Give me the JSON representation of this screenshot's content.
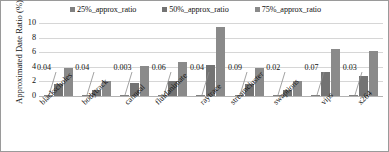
{
  "chart": {
    "ylabel": "Approximated Date Ratio (%)",
    "yticks": [
      "10",
      "8",
      "6",
      "4",
      "2",
      "0"
    ]
  },
  "legend": [
    {
      "label": "25%_approx_ratio",
      "color": "#808080"
    },
    {
      "label": "50%_approx_ratio",
      "color": "#737373"
    },
    {
      "label": "75%_approx_ratio",
      "color": "#8a8a8a"
    }
  ],
  "groups": [
    {
      "category": "blackscholes",
      "callout": "0.04"
    },
    {
      "category": "bodytrack",
      "callout": "0.04"
    },
    {
      "category": "canneal",
      "callout": "0.003"
    },
    {
      "category": "fluidanimate",
      "callout": "0.06"
    },
    {
      "category": "raytrace",
      "callout": "0.04"
    },
    {
      "category": "streamcluster",
      "callout": "0.09"
    },
    {
      "category": "swaptions",
      "callout": "0.02"
    },
    {
      "category": "vips",
      "callout": "0.07"
    },
    {
      "category": "x264",
      "callout": "0.03"
    }
  ],
  "chart_data": {
    "type": "bar",
    "title": "",
    "xlabel": "",
    "ylabel": "Approximated Date Ratio (%)",
    "ylim": [
      0,
      10
    ],
    "ytick_values": [
      0,
      2,
      4,
      6,
      8,
      10
    ],
    "grid": true,
    "legend_position": "top-center",
    "categories": [
      "blackscholes",
      "bodytrack",
      "canneal",
      "fluidanimate",
      "raytrace",
      "streamcluster",
      "swaptions",
      "vips",
      "x264"
    ],
    "series": [
      {
        "name": "25%_approx_ratio",
        "color": "#808080",
        "values": [
          0.04,
          0.04,
          0.003,
          0.06,
          0.04,
          0.09,
          0.02,
          0.07,
          0.03
        ]
      },
      {
        "name": "50%_approx_ratio",
        "color": "#737373",
        "values": [
          1.7,
          0.85,
          1.8,
          2.0,
          4.3,
          1.7,
          0.85,
          3.35,
          2.75
        ]
      },
      {
        "name": "75%_approx_ratio",
        "color": "#8a8a8a",
        "values": [
          3.85,
          2.05,
          4.1,
          4.6,
          9.4,
          3.9,
          2.0,
          6.5,
          6.2
        ]
      }
    ],
    "data_labels": {
      "series": "25%_approx_ratio",
      "values": [
        "0.04",
        "0.04",
        "0.003",
        "0.06",
        "0.04",
        "0.09",
        "0.02",
        "0.07",
        "0.03"
      ]
    }
  }
}
